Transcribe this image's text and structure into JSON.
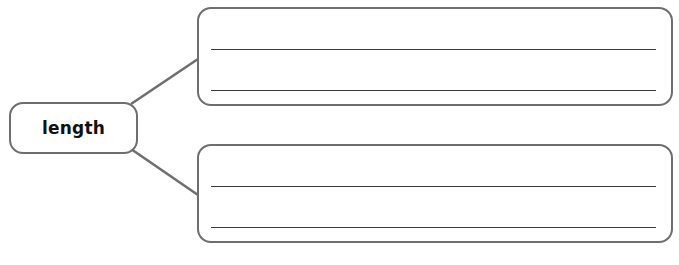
{
  "diagram": {
    "type": "graphic-organizer",
    "center_node": {
      "label": "length"
    },
    "branches": [
      {
        "id": "top",
        "writing_lines": 2,
        "content": [
          "",
          ""
        ]
      },
      {
        "id": "bottom",
        "writing_lines": 2,
        "content": [
          "",
          ""
        ]
      }
    ],
    "colors": {
      "border": "#6e6e6e",
      "connector": "#6e6e6e",
      "writing_line": "#3a3a3a",
      "text": "#111111"
    }
  }
}
